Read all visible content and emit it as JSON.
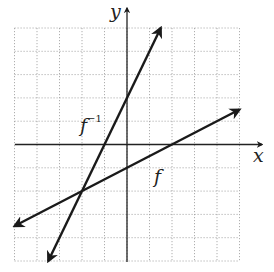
{
  "figure": {
    "type": "diagram",
    "axis_labels": {
      "x": "x",
      "y": "y"
    },
    "function_labels": {
      "f": "f",
      "f_inverse_base": "f",
      "f_inverse_sup": "−1"
    },
    "grid": {
      "x_range": [
        -5,
        5
      ],
      "y_range": [
        -5,
        5
      ],
      "step": 1
    },
    "lines": [
      {
        "name": "f",
        "equation": "y = x/2 - 1",
        "from": [
          -5,
          -3.5
        ],
        "to": [
          5,
          1.5
        ]
      },
      {
        "name": "f^-1",
        "equation": "y = 2x + 2",
        "from": [
          -3.5,
          -5
        ],
        "to": [
          1.5,
          5
        ]
      }
    ],
    "intersection": [
      -2,
      -2
    ],
    "colors": {
      "line": "#1a1a1a",
      "grid": "#9a9a9a",
      "background": "#ffffff"
    }
  }
}
